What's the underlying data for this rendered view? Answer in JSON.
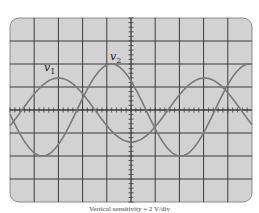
{
  "diagram": {
    "type": "oscilloscope-screen",
    "screen": {
      "left": 10,
      "top": 18,
      "right": 252,
      "bottom": 202,
      "h_divisions": 10,
      "v_divisions": 8
    },
    "colors": {
      "screen_bg": "#d2d2d2",
      "grid": "#3c3c3c",
      "trace": "#7a7a7a",
      "frame": "#8a8a8a"
    },
    "traces": [
      {
        "label": "v",
        "subscript": "1",
        "amplitude_px": 32,
        "period_px": 146,
        "phase_zero_up_x": 22,
        "label_x": 44,
        "label_y": 71
      },
      {
        "label": "v",
        "subscript": "2",
        "amplitude_px": 46,
        "period_px": 138,
        "phase_zero_up_x": 77,
        "label_x": 110,
        "label_y": 60
      }
    ],
    "caption": "Vertical sensitivity = 2 V/div"
  }
}
